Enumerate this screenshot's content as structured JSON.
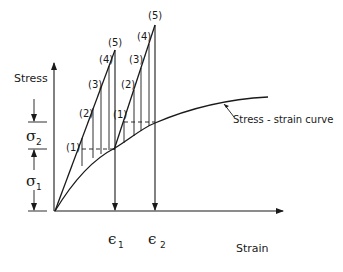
{
  "axes": {
    "y_label": "Stress",
    "x_label": "Strain"
  },
  "curve": {
    "label": "Stress - strain curve"
  },
  "stress_marks": {
    "sigma1": {
      "symbol": "σ",
      "sub": "1"
    },
    "sigma2": {
      "symbol": "σ",
      "sub": "2"
    }
  },
  "strain_marks": {
    "eps1": {
      "symbol": "ϵ",
      "sub": "1"
    },
    "eps2": {
      "symbol": "ϵ",
      "sub": "2"
    }
  },
  "load_line_1": {
    "labels": [
      "(1)",
      "(2)",
      "(3)",
      "(4)",
      "(5)"
    ]
  },
  "load_line_2": {
    "labels": [
      "(1)",
      "(2)",
      "(3)",
      "(4)",
      "(5)"
    ]
  }
}
